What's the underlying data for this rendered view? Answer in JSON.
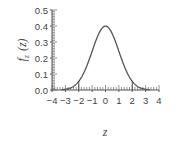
{
  "chart_data": {
    "type": "line",
    "title": "",
    "xlabel": "z",
    "ylabel": "f_z(z)",
    "ylabel_main": "f",
    "ylabel_sub": "z",
    "ylabel_arg": "(z)",
    "xlim": [
      -4,
      4
    ],
    "ylim": [
      0.0,
      0.5
    ],
    "grid": false,
    "legend": null,
    "x_ticks": [
      -4,
      -3,
      -2,
      -1,
      0,
      1,
      2,
      3,
      4
    ],
    "x_tick_labels": [
      "−4",
      "−3",
      "−2",
      "−1",
      "0",
      "1",
      "2",
      "3",
      "4"
    ],
    "y_ticks": [
      0.0,
      0.1,
      0.2,
      0.3,
      0.4,
      0.5
    ],
    "y_tick_labels": [
      "0.0",
      "0.1",
      "0.2",
      "0.3",
      "0.4",
      "0.5"
    ],
    "series": [
      {
        "name": "Standard normal PDF",
        "x": [
          -4,
          -3.5,
          -3,
          -2.5,
          -2,
          -1.5,
          -1,
          -0.5,
          0,
          0.5,
          1,
          1.5,
          2,
          2.5,
          3,
          3.5,
          4
        ],
        "values": [
          0.0001,
          0.0009,
          0.0044,
          0.0175,
          0.054,
          0.1295,
          0.242,
          0.3521,
          0.3989,
          0.3521,
          0.242,
          0.1295,
          0.054,
          0.0175,
          0.0044,
          0.0009,
          0.0001
        ]
      }
    ],
    "annotations": [
      {
        "type": "vertical_line",
        "x": -2,
        "from": 0,
        "to": 0.054
      },
      {
        "type": "vertical_line",
        "x": 2,
        "from": 0,
        "to": 0.054
      }
    ]
  }
}
